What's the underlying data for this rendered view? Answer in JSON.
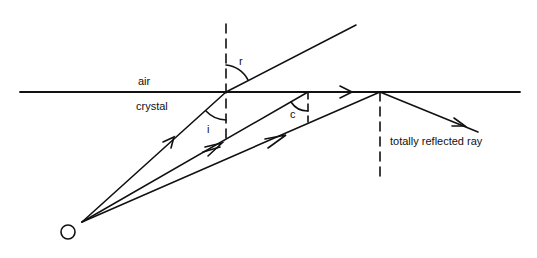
{
  "diagram": {
    "labels": {
      "upper_medium": "air",
      "lower_medium": "crystal",
      "angle_refraction": "r",
      "angle_incidence": "i",
      "critical_angle": "c",
      "reflected_ray": "totally reflected ray",
      "source": "O"
    },
    "colors": {
      "line": "#111111",
      "background": "#ffffff"
    }
  }
}
